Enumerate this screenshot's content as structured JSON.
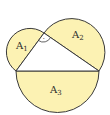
{
  "diagram": {
    "colors": {
      "fill": "#fcf2b3",
      "stroke": "#3a3a3a",
      "triangle_fill": "#ffffff"
    },
    "labels": {
      "a1": {
        "main": "A",
        "sub": "1"
      },
      "a2": {
        "main": "A",
        "sub": "2"
      },
      "a3": {
        "main": "A",
        "sub": "3"
      },
      "right_angle_mark": "·"
    }
  }
}
